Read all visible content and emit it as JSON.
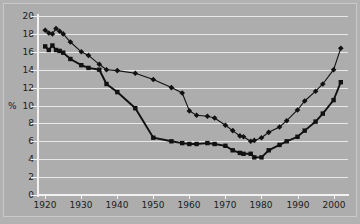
{
  "axis": {
    "ylabel": "%",
    "yticks": [
      0,
      2,
      4,
      6,
      8,
      10,
      12,
      14,
      16,
      18,
      20
    ],
    "xticks": [
      1920,
      1930,
      1940,
      1950,
      1960,
      1970,
      1980,
      1990,
      2000
    ],
    "ylim": [
      0,
      20
    ],
    "xlim": [
      1918,
      2004
    ]
  },
  "colors": {
    "background": "#adadad",
    "gridline": "#e8e8e8",
    "axis": "#f2f2f2",
    "series": "#111111",
    "border": "#c9c9c9"
  },
  "chart_data": {
    "type": "line",
    "title": "",
    "xlabel": "",
    "ylabel": "%",
    "ylim": [
      0,
      20
    ],
    "xlim": [
      1918,
      2004
    ],
    "grid": true,
    "legend": "none",
    "series": [
      {
        "name": "upper-series",
        "marker": "diamond",
        "x": [
          1920,
          1921,
          1922,
          1923,
          1924,
          1925,
          1927,
          1930,
          1932,
          1935,
          1937,
          1940,
          1945,
          1950,
          1955,
          1958,
          1960,
          1962,
          1965,
          1967,
          1970,
          1972,
          1974,
          1975,
          1977,
          1978,
          1980,
          1982,
          1985,
          1987,
          1990,
          1992,
          1995,
          1997,
          2000,
          2002
        ],
        "values": [
          18.4,
          18.1,
          18.0,
          18.6,
          18.3,
          18.0,
          17.1,
          16.0,
          15.6,
          14.6,
          14.0,
          13.9,
          13.6,
          12.9,
          12.0,
          11.4,
          9.4,
          8.9,
          8.8,
          8.6,
          7.8,
          7.2,
          6.6,
          6.5,
          6.0,
          6.1,
          6.4,
          7.0,
          7.6,
          8.3,
          9.5,
          10.5,
          11.6,
          12.4,
          14.0,
          16.4
        ]
      },
      {
        "name": "lower-series",
        "marker": "square",
        "x": [
          1920,
          1921,
          1922,
          1923,
          1924,
          1925,
          1927,
          1930,
          1932,
          1935,
          1937,
          1940,
          1945,
          1950,
          1955,
          1958,
          1960,
          1962,
          1965,
          1967,
          1970,
          1972,
          1974,
          1975,
          1977,
          1978,
          1980,
          1982,
          1985,
          1987,
          1990,
          1992,
          1995,
          1997,
          2000,
          2002
        ],
        "values": [
          16.6,
          16.2,
          16.7,
          16.2,
          16.1,
          15.9,
          15.2,
          14.5,
          14.2,
          14.0,
          12.4,
          11.5,
          9.7,
          6.4,
          6.0,
          5.8,
          5.7,
          5.7,
          5.8,
          5.7,
          5.5,
          5.0,
          4.7,
          4.6,
          4.6,
          4.2,
          4.2,
          5.0,
          5.6,
          6.0,
          6.5,
          7.2,
          8.2,
          9.1,
          10.6,
          12.6
        ]
      }
    ]
  }
}
